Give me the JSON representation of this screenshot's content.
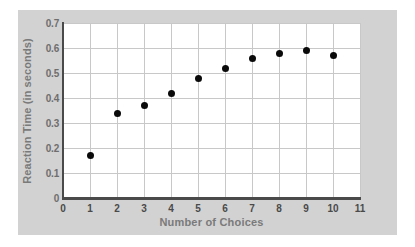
{
  "chart_data": {
    "type": "scatter",
    "title": "",
    "xlabel": "Number of Choices",
    "ylabel": "Reaction Time (in seconds)",
    "xlim": [
      0,
      11
    ],
    "ylim": [
      0,
      0.7
    ],
    "grid": true,
    "legend": null,
    "x": [
      1,
      2,
      3,
      4,
      5,
      6,
      7,
      8,
      9,
      10
    ],
    "values": [
      0.17,
      0.34,
      0.37,
      0.42,
      0.48,
      0.52,
      0.56,
      0.58,
      0.59,
      0.57
    ],
    "xticks": [
      "0",
      "1",
      "2",
      "3",
      "4",
      "5",
      "6",
      "7",
      "8",
      "9",
      "10",
      "11"
    ],
    "xtick_values": [
      0,
      1,
      2,
      3,
      4,
      5,
      6,
      7,
      8,
      9,
      10,
      11
    ],
    "yticks": [
      "0",
      "0.1",
      "0.2",
      "0.3",
      "0.4",
      "0.5",
      "0.6",
      "0.7"
    ],
    "ytick_values": [
      0,
      0.1,
      0.2,
      0.3,
      0.4,
      0.5,
      0.6,
      0.7
    ],
    "marker_color": "#0a0a0a",
    "gridline_color": "#c8c8c8",
    "axis_color": "#4a4a4a",
    "panel_color": "#d2d2d2",
    "plot_background": "#ffffff",
    "axis_title_color": "#7a7a7a"
  }
}
